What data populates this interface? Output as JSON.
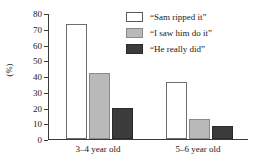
{
  "chart_data": {
    "type": "bar",
    "title": "",
    "xlabel": "",
    "ylabel": "(%)",
    "ylim": [
      0,
      80
    ],
    "yticks": [
      0,
      10,
      20,
      30,
      40,
      50,
      60,
      70,
      80
    ],
    "categories": [
      "3–4 year old",
      "5–6 year old"
    ],
    "grid": false,
    "legend_position": "upper right",
    "series": [
      {
        "name": "“Sam ripped it”",
        "color": "#ffffff",
        "edge_color": "#6e6e6e",
        "values": [
          73,
          36
        ]
      },
      {
        "name": "“I saw him do it”",
        "color": "#b9b9b9",
        "edge_color": "#8a8a8a",
        "values": [
          42,
          13
        ]
      },
      {
        "name": "“He really did”",
        "color": "#3b3b3b",
        "edge_color": "#2a2a2a",
        "values": [
          20,
          8
        ]
      }
    ]
  }
}
